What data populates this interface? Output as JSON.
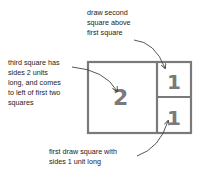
{
  "annotations": {
    "second_square": "draw second\nsquare above\nfirst square",
    "third_square": "third square has\nsides 2 units\nlong, and comes\nto left of first two\nsquares",
    "first_square": "first draw square with\nsides 1 unit long"
  },
  "squares": [
    {
      "name": "square-2",
      "label": "2"
    },
    {
      "name": "square-1-top",
      "label": "1"
    },
    {
      "name": "square-1-bottom",
      "label": "1"
    }
  ],
  "colors": {
    "stroke": "#7a7a7a",
    "number": "#7a7a7a",
    "arrow": "#444444",
    "text": "#222222"
  }
}
